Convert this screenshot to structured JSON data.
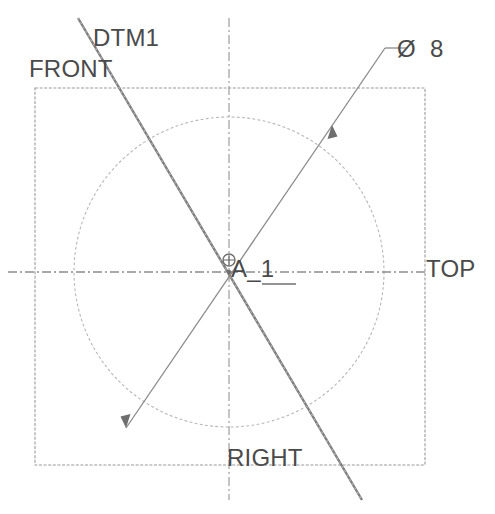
{
  "drawing": {
    "title": "Datum axis A_1 reference drawing",
    "background_color": "#ffffff",
    "line_color": "#888888",
    "text_color": "#4a4a4a",
    "labels": {
      "datum_plane_1": "DTM1",
      "view_front": "FRONT",
      "view_top": "TOP",
      "view_right": "RIGHT",
      "axis_name": "A_1",
      "diameter_symbol": "Ø",
      "diameter_value": "8"
    },
    "geometry": {
      "square_boundary": {
        "x": 35,
        "y": 88,
        "width": 390,
        "height": 377
      },
      "circle": {
        "cx": 229,
        "cy": 272,
        "r": 155
      },
      "center_point": {
        "x": 229,
        "y": 272
      },
      "horizontal_centerline": {
        "x1": 8,
        "y1": 272,
        "x2": 425,
        "y2": 272
      },
      "vertical_centerline": {
        "x1": 229,
        "y1": 18,
        "x2": 229,
        "y2": 500
      },
      "datum_line_dtm1": {
        "x1": 78,
        "y1": 18,
        "x2": 362,
        "y2": 500
      },
      "leader_diameter": {
        "x1": 126,
        "y1": 428,
        "x2": 385,
        "y2": 48,
        "jog_x": 405,
        "jog_y": 48
      },
      "arrow_upper": {
        "x": 332,
        "y": 125
      },
      "arrow_lower": {
        "x": 126,
        "y": 428
      }
    }
  }
}
